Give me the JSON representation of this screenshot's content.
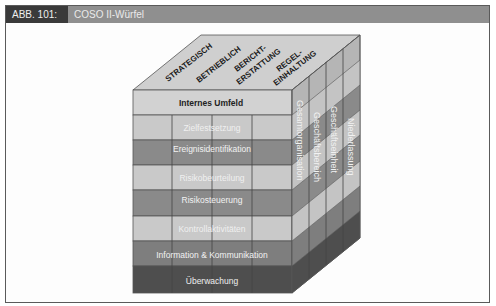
{
  "figure": {
    "number": "ABB. 101:",
    "title": "COSO II-Würfel"
  },
  "cube": {
    "top_labels": [
      {
        "line1": "STRATEGISCH",
        "line2": ""
      },
      {
        "line1": "BETRIEBLICH",
        "line2": ""
      },
      {
        "line1": "BERICHT-",
        "line2": "ERSTATTUNG"
      },
      {
        "line1": "REGEL-",
        "line2": "EINHALTUNG"
      }
    ],
    "front_rows": [
      {
        "label": "Internes Umfeld",
        "fill": "#d2d2d2",
        "text": "#222222"
      },
      {
        "label": "Zielfestsetzung",
        "fill": "#c9c9c9",
        "text": "#f0f0f0"
      },
      {
        "label": "Ereignisidentifikation",
        "fill": "#8a8a8a",
        "text": "#f2f2f2"
      },
      {
        "label": "Risikobeurteilung",
        "fill": "#c9c9c9",
        "text": "#f0f0f0"
      },
      {
        "label": "Risikosteuerung",
        "fill": "#8a8a8a",
        "text": "#f2f2f2"
      },
      {
        "label": "Kontrollaktivitäten",
        "fill": "#c9c9c9",
        "text": "#f0f0f0"
      },
      {
        "label": "Information & Kommunikation",
        "fill": "#7e7e7e",
        "text": "#f2f2f2"
      },
      {
        "label": "Überwachung",
        "fill": "#4e4e4e",
        "text": "#eeeeee"
      }
    ],
    "side_labels": [
      "Gesamtorganisation",
      "Geschäftsbereich",
      "Geschäftseinheit",
      "Niederlassung"
    ]
  }
}
